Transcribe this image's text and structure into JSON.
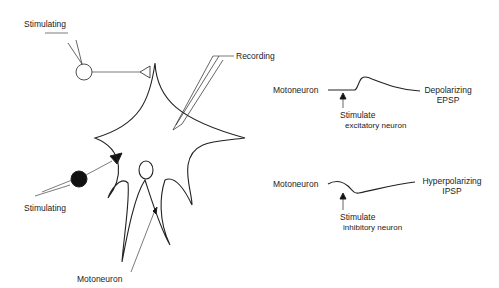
{
  "labels": {
    "stimulating_top": "Stimulating",
    "stimulating_bottom": "Stimulating",
    "recording": "Recording",
    "motoneuron_cell": "Motoneuron"
  },
  "epsp_trace": {
    "left_label": "Motoneuron",
    "right_label_line1": "Depolarizing",
    "right_label_line2": "EPSP",
    "stim_line1": "Stimulate",
    "stim_line2": "excitatory neuron"
  },
  "ipsp_trace": {
    "left_label": "Motoneuron",
    "right_label_line1": "Hyperpolarizing",
    "right_label_line2": "IPSP",
    "stim_line1": "Stimulate",
    "stim_line2": "inhibitory neuron"
  },
  "colors": {
    "line": "#222222",
    "background": "#ffffff"
  }
}
